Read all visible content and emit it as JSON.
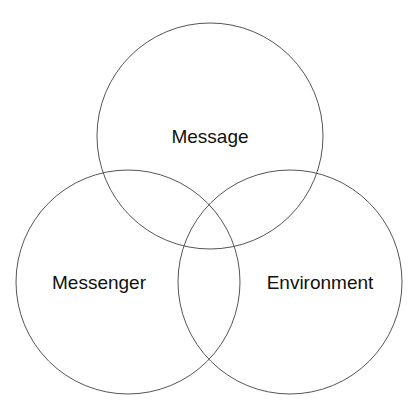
{
  "diagram": {
    "type": "venn",
    "sets": [
      {
        "id": "message",
        "label": "Message",
        "cx": 210,
        "cy": 136,
        "r": 113
      },
      {
        "id": "messenger",
        "label": "Messenger",
        "cx": 128,
        "cy": 282,
        "r": 112
      },
      {
        "id": "environment",
        "label": "Environment",
        "cx": 290,
        "cy": 282,
        "r": 112
      }
    ],
    "stroke_color": "#555555",
    "text_color": "#111111"
  }
}
